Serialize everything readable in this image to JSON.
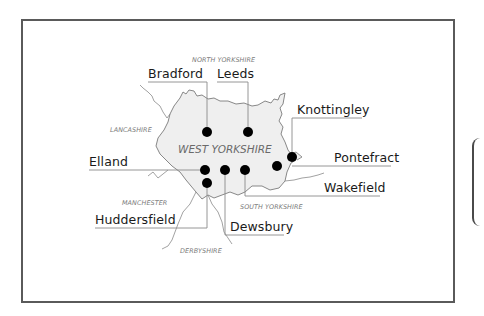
{
  "map": {
    "title_region": "WEST YORKSHIRE",
    "neighbouring_regions": [
      {
        "name": "NORTH YORKSHIRE"
      },
      {
        "name": "LANCASHIRE"
      },
      {
        "name": "MANCHESTER"
      },
      {
        "name": "SOUTH YORKSHIRE"
      },
      {
        "name": "DERBYSHIRE"
      }
    ],
    "towns": [
      {
        "name": "Bradford"
      },
      {
        "name": "Leeds"
      },
      {
        "name": "Knottingley"
      },
      {
        "name": "Elland"
      },
      {
        "name": "Pontefract"
      },
      {
        "name": "Wakefield"
      },
      {
        "name": "Huddersfield"
      },
      {
        "name": "Dewsbury"
      }
    ],
    "colors": {
      "county_fill": "#efefef",
      "boundary": "#7a7a7a",
      "leader_line": "#8a8a8a",
      "dot": "#000000",
      "frame": "#5a5a5a"
    }
  }
}
